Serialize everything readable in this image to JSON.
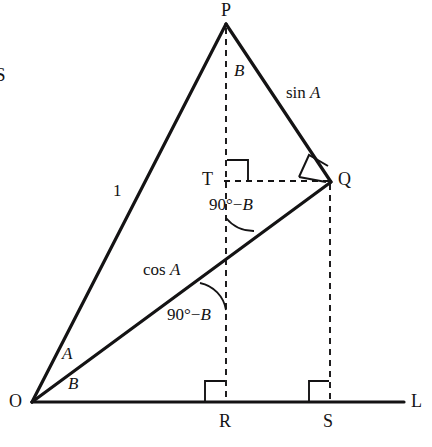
{
  "figure": {
    "type": "geometry-diagram",
    "stroke_color": "#141314",
    "background": "#ffffff",
    "points": [
      {
        "id": "P",
        "label": "P",
        "x": 226,
        "y": 24,
        "label_x": 221,
        "label_y": 2
      },
      {
        "id": "Q",
        "label": "Q",
        "x": 330,
        "y": 181,
        "label_x": 338,
        "label_y": 171
      },
      {
        "id": "T",
        "label": "T",
        "x": 226,
        "y": 181,
        "label_x": 203,
        "label_y": 171
      },
      {
        "id": "O",
        "label": "O",
        "x": 32,
        "y": 402,
        "label_x": 10,
        "label_y": 392
      },
      {
        "id": "R",
        "label": "R",
        "x": 226,
        "y": 402,
        "label_x": 220,
        "label_y": 412
      },
      {
        "id": "S",
        "label": "S",
        "x": 330,
        "y": 402,
        "label_x": 324,
        "label_y": 412
      },
      {
        "id": "L",
        "label": "L",
        "x": 404,
        "y": 402,
        "label_x": 411,
        "label_y": 392
      }
    ],
    "solid_segments": [
      {
        "name": "OP",
        "from": "O",
        "to": "P"
      },
      {
        "name": "PQ",
        "from": "P",
        "to": "Q"
      },
      {
        "name": "OQ",
        "from": "O",
        "to": "Q"
      },
      {
        "name": "OL",
        "from": "O",
        "to": "L"
      }
    ],
    "dashed_segments": [
      {
        "name": "PR",
        "from": "P",
        "to": "R"
      },
      {
        "name": "TQ",
        "from": "T",
        "to": "Q"
      },
      {
        "name": "QS",
        "from": "Q",
        "to": "S"
      }
    ],
    "labels": [
      {
        "id": "side-op",
        "text": "1",
        "x": 113,
        "y": 182,
        "style": "plain"
      },
      {
        "id": "side-pq",
        "text": "sin A",
        "x": 286,
        "y": 84,
        "style": "function"
      },
      {
        "id": "side-oq",
        "text": "cos A",
        "x": 143,
        "y": 261,
        "style": "function"
      },
      {
        "id": "angle-p",
        "text": "B",
        "x": 234,
        "y": 62,
        "style": "italic"
      },
      {
        "id": "angle-o-upper",
        "text": "A",
        "x": 62,
        "y": 345,
        "style": "italic"
      },
      {
        "id": "angle-o-lower",
        "text": "B",
        "x": 68,
        "y": 375,
        "style": "italic"
      },
      {
        "id": "angle-t",
        "text": "90°−B",
        "x": 209,
        "y": 196,
        "style": "expression"
      },
      {
        "id": "angle-q-lower",
        "text": "90°−B",
        "x": 167,
        "y": 306,
        "style": "expression"
      },
      {
        "id": "page-edge-letter",
        "text": "S",
        "x": -5,
        "y": 64,
        "style": "clipped"
      }
    ],
    "right_angle_marks": [
      {
        "id": "right-angle-at-r",
        "vertex": "R",
        "orientation": "upper-left"
      },
      {
        "id": "right-angle-at-s",
        "vertex": "S",
        "orientation": "upper-left"
      },
      {
        "id": "right-angle-at-t",
        "vertex": "T",
        "orientation": "upper-right"
      },
      {
        "id": "right-angle-at-q",
        "vertex": "Q",
        "orientation": "rotated"
      }
    ],
    "angle_arcs": [
      {
        "id": "arc-angle-t",
        "at": "T",
        "describes": "90°−B between TR and TQ-ray"
      },
      {
        "id": "arc-angle-oq",
        "at": "OQ-crossing",
        "describes": "90°−B between OQ and vertical PR"
      }
    ]
  }
}
